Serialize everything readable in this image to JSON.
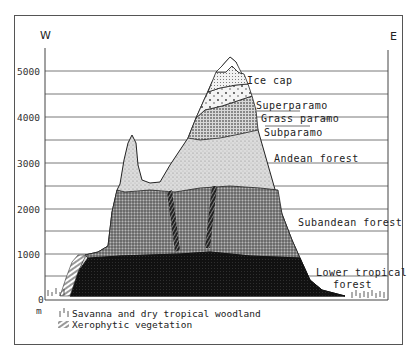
{
  "diagram": {
    "type": "altitudinal vegetation zonation profile",
    "orientation": {
      "left": "W",
      "right": "E"
    },
    "axis": {
      "unit": "m",
      "ticks": [
        "0",
        "1000",
        "2000",
        "3000",
        "4000",
        "5000"
      ],
      "minor_step": 500
    },
    "zones": [
      {
        "id": "ice-cap",
        "label": "Ice cap"
      },
      {
        "id": "superparamo",
        "label": "Superparamo"
      },
      {
        "id": "grass-paramo",
        "label": "Grass paramo"
      },
      {
        "id": "subparamo",
        "label": "Subparamo"
      },
      {
        "id": "andean-forest",
        "label": "Andean forest"
      },
      {
        "id": "subandean-forest",
        "label": "Subandean forest"
      },
      {
        "id": "lower-tropical-forest",
        "label_line1": "Lower tropical",
        "label_line2": "forest"
      }
    ],
    "legend": [
      {
        "symbol": "savanna-tick-symbol",
        "label": "Savanna and dry tropical woodland"
      },
      {
        "symbol": "xerophytic-hatch-symbol",
        "label": "Xerophytic vegetation"
      }
    ]
  },
  "colors": {
    "lower_tropical_forest": "#111111",
    "subandean_forest": "#6e6e6e",
    "andean_forest": "#c9c9c9",
    "paramo": "#ececec",
    "ice_cap": "#ffffff",
    "lines": "#444444"
  }
}
